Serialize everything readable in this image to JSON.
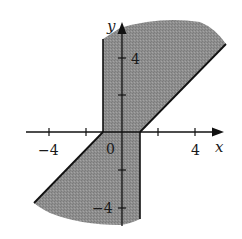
{
  "figure": {
    "axes": {
      "x_label": "x",
      "y_label": "y",
      "x_ticks": [
        {
          "value": -4,
          "label": "−4"
        },
        {
          "value": -2,
          "label": ""
        },
        {
          "value": 0,
          "label": "0"
        },
        {
          "value": 2,
          "label": ""
        },
        {
          "value": 4,
          "label": "4"
        }
      ],
      "y_ticks": [
        {
          "value": 4,
          "label": "4"
        },
        {
          "value": 2,
          "label": ""
        },
        {
          "value": -2,
          "label": ""
        },
        {
          "value": -4,
          "label": "−4"
        }
      ]
    },
    "boundaries": [
      {
        "type": "vertical",
        "x": -1,
        "from_y": 0,
        "to_y": 5.5
      },
      {
        "type": "vertical",
        "x": 1,
        "from_y": -5,
        "to_y": 0
      },
      {
        "type": "line",
        "equation": "y = x - 1",
        "from_x": 1,
        "to_x": 5.8
      },
      {
        "type": "line",
        "equation": "y = x + 1",
        "from_x": -4.9,
        "to_x": -1
      }
    ],
    "colors": {
      "shade": "#8c8c8c",
      "lines": "#111111",
      "background": "#ffffff"
    }
  }
}
